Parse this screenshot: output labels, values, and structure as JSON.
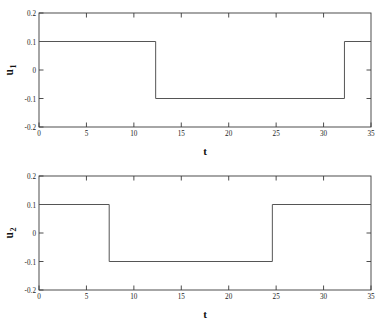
{
  "figure": {
    "name": "control-input-time-history",
    "background": "#ffffff",
    "line_color": "#555555",
    "axis_color": "#3a3a3a",
    "text_color": "#111111"
  },
  "chart_data": [
    {
      "type": "line",
      "id": "u1",
      "title": "",
      "xlabel": "t",
      "ylabel": "u_1",
      "ylabel_base": "u",
      "ylabel_sub": "1",
      "xlim": [
        0,
        35
      ],
      "ylim": [
        -0.2,
        0.2
      ],
      "xticks": [
        0,
        5,
        10,
        15,
        20,
        25,
        30,
        35
      ],
      "xticklabels": [
        "0",
        "5",
        "10",
        "15",
        "20",
        "25",
        "30",
        "35"
      ],
      "yticks": [
        -0.2,
        -0.1,
        0,
        0.1,
        0.2
      ],
      "yticklabels": [
        "-0.2",
        "-0.1",
        "0",
        "0.1",
        "0.2"
      ],
      "grid": false,
      "legend": null,
      "series": [
        {
          "name": "u1",
          "style": "step",
          "x": [
            0,
            12.3,
            12.3,
            32.2,
            32.2,
            35
          ],
          "y": [
            0.1,
            0.1,
            -0.1,
            -0.1,
            0.1,
            0.1
          ]
        }
      ],
      "switch_times": [
        12.3,
        32.2
      ],
      "levels": [
        0.1,
        -0.1,
        0.1
      ]
    },
    {
      "type": "line",
      "id": "u2",
      "title": "",
      "xlabel": "t",
      "ylabel": "u_2",
      "ylabel_base": "u",
      "ylabel_sub": "2",
      "xlim": [
        0,
        35
      ],
      "ylim": [
        -0.2,
        0.2
      ],
      "xticks": [
        0,
        5,
        10,
        15,
        20,
        25,
        30,
        35
      ],
      "xticklabels": [
        "0",
        "5",
        "10",
        "15",
        "20",
        "25",
        "30",
        "35"
      ],
      "yticks": [
        -0.2,
        -0.1,
        0,
        0.1,
        0.2
      ],
      "yticklabels": [
        "-0.2",
        "-0.1",
        "0",
        "0.1",
        "0.2"
      ],
      "grid": false,
      "legend": null,
      "series": [
        {
          "name": "u2",
          "style": "step",
          "x": [
            0,
            7.4,
            7.4,
            24.6,
            24.6,
            35
          ],
          "y": [
            0.1,
            0.1,
            -0.1,
            -0.1,
            0.1,
            0.1
          ]
        }
      ],
      "switch_times": [
        7.4,
        24.6
      ],
      "levels": [
        0.1,
        -0.1,
        0.1
      ]
    }
  ]
}
